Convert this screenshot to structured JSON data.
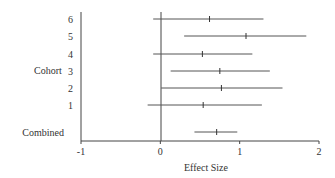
{
  "chart_data": {
    "type": "forest",
    "title": "",
    "xlabel": "Effect Size",
    "ylabel": "Cohort",
    "xlim": [
      -1,
      2
    ],
    "xticks": [
      -1,
      0,
      1,
      2
    ],
    "xtick_labels": [
      "-1",
      "0",
      "1",
      "2"
    ],
    "reference_line": 0,
    "grid": false,
    "legend": null,
    "rows": [
      {
        "label": "6",
        "estimate": 0.62,
        "lower": -0.09,
        "upper": 1.3
      },
      {
        "label": "5",
        "estimate": 1.08,
        "lower": 0.3,
        "upper": 1.84
      },
      {
        "label": "4",
        "estimate": 0.53,
        "lower": -0.09,
        "upper": 1.16
      },
      {
        "label": "3",
        "estimate": 0.75,
        "lower": 0.13,
        "upper": 1.38
      },
      {
        "label": "2",
        "estimate": 0.77,
        "lower": 0.01,
        "upper": 1.54
      },
      {
        "label": "1",
        "estimate": 0.54,
        "lower": -0.16,
        "upper": 1.28
      },
      {
        "label": "Combined",
        "estimate": 0.71,
        "lower": 0.43,
        "upper": 0.97
      }
    ]
  },
  "labels": {
    "group_label": "Cohort",
    "combined_label": "Combined",
    "x_axis_title": "Effect Size"
  }
}
